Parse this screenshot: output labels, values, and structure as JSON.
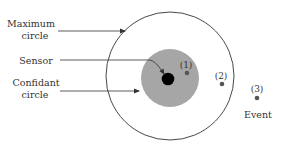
{
  "labels": {
    "maximum_circle_line1": "Maximum",
    "maximum_circle_line2": "circle",
    "sensor": "Sensor",
    "confidant_circle_line1": "Confidant",
    "confidant_circle_line2": "circle",
    "event": "Event"
  },
  "events": [
    {
      "id": "1",
      "label": "(1)",
      "zone": "inside confidant circle"
    },
    {
      "id": "2",
      "label": "(2)",
      "zone": "inside maximum circle"
    },
    {
      "id": "3",
      "label": "(3)",
      "zone": "outside maximum circle"
    }
  ],
  "colors": {
    "outline": "#333333",
    "confidant_fill": "#a6a6a6",
    "sensor_fill": "#000000",
    "event_fill": "#555555",
    "text": "#333333"
  }
}
